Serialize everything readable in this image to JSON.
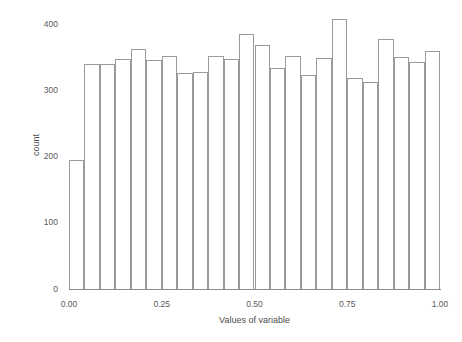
{
  "chart_data": {
    "type": "bar",
    "title": "",
    "subtitle": "",
    "xlabel": "Values of variable",
    "ylabel": "count",
    "grid": false,
    "legend": false,
    "xlim": [
      0.0,
      1.0
    ],
    "ylim": [
      0,
      420
    ],
    "x_ticks": [
      {
        "value": 0.0,
        "label": "0.00"
      },
      {
        "value": 0.25,
        "label": "0.25"
      },
      {
        "value": 0.5,
        "label": "0.50"
      },
      {
        "value": 0.75,
        "label": "0.75"
      },
      {
        "value": 1.0,
        "label": "1.00"
      }
    ],
    "y_ticks": [
      {
        "value": 0,
        "label": "0"
      },
      {
        "value": 100,
        "label": "100"
      },
      {
        "value": 200,
        "label": "200"
      },
      {
        "value": 300,
        "label": "300"
      },
      {
        "value": 400,
        "label": "400"
      }
    ],
    "bin_count": 24,
    "bin_width": 0.041667,
    "bin_edges": [
      0.0,
      0.041667,
      0.083333,
      0.125,
      0.166667,
      0.208333,
      0.25,
      0.291667,
      0.333333,
      0.375,
      0.416667,
      0.458333,
      0.5,
      0.541667,
      0.583333,
      0.625,
      0.666667,
      0.708333,
      0.75,
      0.791667,
      0.833333,
      0.875,
      0.916667,
      0.958333,
      1.0
    ],
    "categories": [
      "0.000",
      "0.042",
      "0.083",
      "0.125",
      "0.167",
      "0.208",
      "0.250",
      "0.292",
      "0.333",
      "0.375",
      "0.417",
      "0.458",
      "0.500",
      "0.542",
      "0.583",
      "0.625",
      "0.667",
      "0.708",
      "0.750",
      "0.792",
      "0.833",
      "0.875",
      "0.917",
      "0.958"
    ],
    "values": [
      195,
      340,
      340,
      347,
      362,
      345,
      352,
      326,
      327,
      352,
      347,
      385,
      368,
      333,
      352,
      323,
      348,
      408,
      318,
      313,
      378,
      350,
      342,
      360
    ],
    "bar_style": {
      "fill": "#ffffff",
      "edge": "#9a9a9a",
      "edge_width": 1
    }
  },
  "axes": {
    "axis_color": "#8c8c8c",
    "tick_label_color": "#595959",
    "axis_title_color": "#4d4d4d"
  }
}
